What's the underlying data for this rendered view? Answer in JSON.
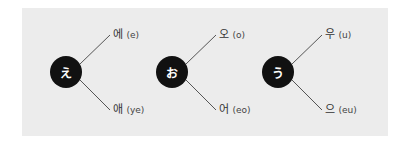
{
  "diagram": {
    "groups": [
      {
        "kana": "え",
        "upper": {
          "hangul": "에",
          "roman": "(e)"
        },
        "lower": {
          "hangul": "애",
          "roman": "(ye)"
        }
      },
      {
        "kana": "お",
        "upper": {
          "hangul": "오",
          "roman": "(o)"
        },
        "lower": {
          "hangul": "어",
          "roman": "(eo)"
        }
      },
      {
        "kana": "う",
        "upper": {
          "hangul": "우",
          "roman": "(u)"
        },
        "lower": {
          "hangul": "으",
          "roman": "(eu)"
        }
      }
    ]
  }
}
